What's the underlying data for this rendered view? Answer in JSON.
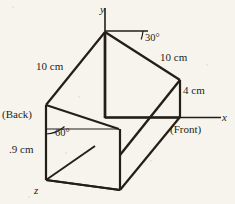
{
  "figure": {
    "kind": "3d-prism-diagram",
    "background_color": "#f6f4ec",
    "ink_color": "#231f18",
    "axes": {
      "y_label": "y",
      "x_label": "x",
      "z_label": "z"
    },
    "labels": {
      "angle_top": "30°",
      "angle_left": "60°",
      "edge_left_slant": "10 cm",
      "edge_right_slant": "10 cm",
      "edge_right_vertical": "4 cm",
      "edge_left_vertical": ".9 cm",
      "face_back": "(Back)",
      "face_front": "(Front)"
    },
    "angle_values": {
      "top_deg": 30,
      "left_deg": 60
    },
    "dimension_values": {
      "left_slant_cm": 10,
      "right_slant_cm": 10,
      "right_vertical_cm": 4,
      "left_vertical_cm": 9
    }
  }
}
